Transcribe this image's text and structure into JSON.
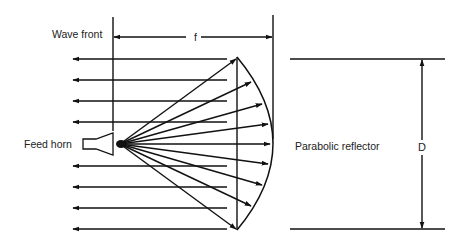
{
  "diagram": {
    "labels": {
      "wave_front": "Wave front",
      "focal_length": "f",
      "feed_horn": "Feed horn",
      "reflector": "Parabolic reflector",
      "diameter": "D"
    },
    "colors": {
      "stroke": "#111111",
      "text": "#222222",
      "background": "#ffffff"
    },
    "geometry": {
      "focus": [
        120,
        144
      ],
      "wavefront_x": 113,
      "reflector_rim_x": 237,
      "reflector_vertex_x": 273,
      "reflector_top_y": 57,
      "reflector_bottom_y": 230,
      "plane_wave_rows_y": [
        59,
        80,
        101,
        122,
        166,
        187,
        208,
        229
      ],
      "plane_wave_arrow_tip_x": 73,
      "plane_wave_end_x": 227,
      "ray_targets": [
        [
          236,
          59
        ],
        [
          251,
          82
        ],
        [
          262,
          104
        ],
        [
          268,
          124
        ],
        [
          270,
          144
        ],
        [
          268,
          164
        ],
        [
          262,
          185
        ],
        [
          251,
          206
        ],
        [
          236,
          229
        ]
      ],
      "aperture_top_y": 59,
      "aperture_bottom_y": 229,
      "diameter_arrow_x": 422
    }
  }
}
